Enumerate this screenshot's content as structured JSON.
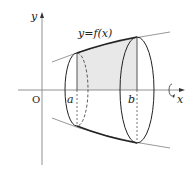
{
  "diagram": {
    "labels": {
      "y_axis": "y",
      "x_axis": "x",
      "origin": "O",
      "curve": "y=f(x)",
      "a": "a",
      "b": "b"
    },
    "colors": {
      "shaded_region": "#e6e6e6",
      "curve_gray": "#999999",
      "outline": "#222222"
    }
  }
}
